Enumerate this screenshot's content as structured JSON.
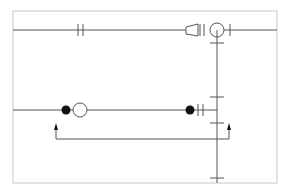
{
  "diagram": {
    "type": "piping-schematic",
    "colors": {
      "line": "#555555",
      "frame": "#c8c8c8",
      "fill": "#111111",
      "background": "#ffffff"
    },
    "frame": {
      "x": 13,
      "y": 11,
      "width": 264,
      "height": 172
    },
    "lines": {
      "top_pipe_y": 30,
      "lower_pipe_y": 110,
      "vertical_riser_x": 217,
      "return_loop_y": 139
    },
    "symbols": [
      {
        "name": "flange-pair",
        "location": "top-pipe",
        "x": 80
      },
      {
        "name": "reducer",
        "location": "top-pipe",
        "x": 190
      },
      {
        "name": "pump",
        "location": "top-pipe",
        "x": 217
      },
      {
        "name": "valve-closed",
        "location": "lower-pipe",
        "x": 66
      },
      {
        "name": "pump",
        "location": "lower-pipe",
        "x": 80
      },
      {
        "name": "valve-closed",
        "location": "lower-pipe",
        "x": 190
      },
      {
        "name": "flange-pair",
        "location": "lower-pipe",
        "x": 200
      },
      {
        "name": "flow-arrow-up",
        "location": "return-loop",
        "x": 56
      },
      {
        "name": "flow-arrow-up",
        "location": "return-loop",
        "x": 229
      }
    ]
  }
}
